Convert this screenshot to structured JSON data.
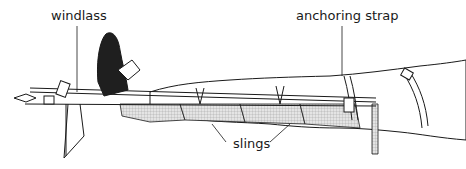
{
  "diagram": {
    "labels": {
      "windlass": "windlass",
      "anchoring_strap": "anchoring strap",
      "slings": "slings"
    },
    "colors": {
      "line": "#1a1a1a",
      "shoe": "#1f1f1f",
      "sling_fill": "#cfcfcf",
      "background": "#ffffff"
    }
  }
}
